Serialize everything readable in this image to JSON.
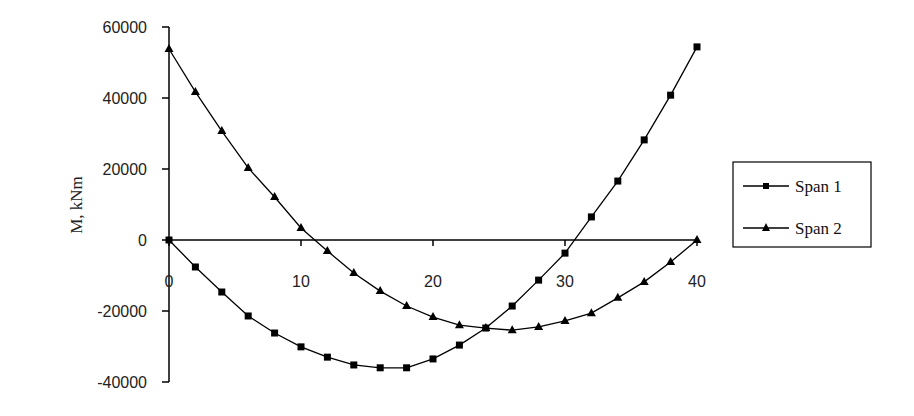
{
  "chart_data": {
    "type": "line",
    "title": "",
    "xlabel": "",
    "ylabel": "M, kNm",
    "xlim": [
      0,
      40
    ],
    "ylim": [
      -40000,
      60000
    ],
    "x_ticks": [
      0,
      10,
      20,
      30,
      40
    ],
    "y_ticks": [
      60000,
      40000,
      20000,
      0,
      -20000,
      -40000
    ],
    "x_tick_labels": [
      "0",
      "10",
      "20",
      "30",
      "40"
    ],
    "y_tick_labels": [
      "60000",
      "40000",
      "20000",
      "0",
      "-20000",
      "-40000"
    ],
    "grid": false,
    "legend_position": "right",
    "x": [
      0,
      2,
      4,
      6,
      8,
      10,
      12,
      14,
      16,
      18,
      20,
      22,
      24,
      26,
      28,
      30,
      32,
      34,
      36,
      38,
      40
    ],
    "series": [
      {
        "name": "Span 1",
        "marker": "square",
        "values": [
          0,
          -7600,
          -14650,
          -21400,
          -26200,
          -30100,
          -33000,
          -35200,
          -36000,
          -36000,
          -33500,
          -29600,
          -24800,
          -18600,
          -11300,
          -3700,
          6500,
          16600,
          28200,
          40800,
          54400
        ]
      },
      {
        "name": "Span 2",
        "marker": "triangle",
        "values": [
          53800,
          41700,
          30700,
          20300,
          12100,
          3400,
          -3100,
          -9300,
          -14400,
          -18600,
          -21700,
          -24000,
          -24800,
          -25400,
          -24500,
          -22800,
          -20600,
          -16300,
          -11800,
          -6200,
          0
        ]
      }
    ]
  },
  "legend": {
    "items": [
      {
        "label": "Span 1"
      },
      {
        "label": "Span 2"
      }
    ]
  },
  "axes": {
    "ylabel": "M, kNm"
  }
}
